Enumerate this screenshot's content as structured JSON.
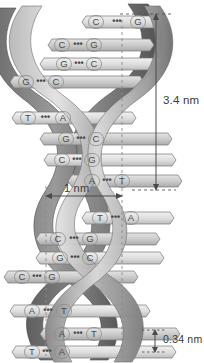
{
  "colors": {
    "background": "#ffffff",
    "ribbon_front_light": "#d8d8d8",
    "ribbon_front_dark": "#8f8f8f",
    "ribbon_back_dark": "#6f6f6f",
    "ribbon_back_darkest": "#555555",
    "rung_fill_light": "#e9e9e9",
    "rung_fill_mid": "#cfcfcf",
    "rung_stroke": "#7a7a7a",
    "base_letter": "#4a4a4a",
    "dimension_line": "#555555",
    "guide_dashed": "#8a8a8a",
    "label_text": "#3a3a3a"
  },
  "dimensions": {
    "pitch": {
      "label": "3.4 nm",
      "name": "helical-pitch",
      "orientation": "vertical",
      "side": "right"
    },
    "diameter": {
      "label": "1 nm",
      "name": "helix-diameter",
      "orientation": "horizontal",
      "side": "middle-left"
    },
    "rise": {
      "label": "0.34 nm",
      "name": "base-pair-rise",
      "orientation": "vertical",
      "side": "bottom-right"
    }
  },
  "base_pairs": [
    {
      "index": 1,
      "left": "C",
      "right": "G",
      "bond": "•••",
      "y": 22,
      "x_left": 96,
      "x_right": 138
    },
    {
      "index": 2,
      "left": "C",
      "right": "G",
      "bond": "•••",
      "y": 45,
      "x_left": 62,
      "x_right": 94
    },
    {
      "index": 3,
      "left": "G",
      "right": "C",
      "bond": "•••",
      "y": 64,
      "x_left": 64,
      "x_right": 94
    },
    {
      "index": 4,
      "left": "G",
      "right": "C",
      "bond": "•••",
      "y": 82,
      "x_left": 26,
      "x_right": 56
    },
    {
      "index": 5,
      "left": "T",
      "right": "A",
      "bond": "•••",
      "y": 118,
      "x_left": 28,
      "x_right": 63
    },
    {
      "index": 6,
      "left": "G",
      "right": "C",
      "bond": "•••",
      "y": 139,
      "x_left": 66,
      "x_right": 96
    },
    {
      "index": 7,
      "left": "C",
      "right": "G",
      "bond": "•••",
      "y": 160,
      "x_left": 62,
      "x_right": 92
    },
    {
      "index": 8,
      "left": "A",
      "right": "T",
      "bond": "•••",
      "y": 181,
      "x_left": 92,
      "x_right": 122
    },
    {
      "index": 9,
      "left": "T",
      "right": "A",
      "bond": "•••",
      "y": 218,
      "x_left": 100,
      "x_right": 131
    },
    {
      "index": 10,
      "left": "C",
      "right": "G",
      "bond": "•••",
      "y": 239,
      "x_left": 58,
      "x_right": 90
    },
    {
      "index": 11,
      "left": "G",
      "right": "C",
      "bond": "•••",
      "y": 258,
      "x_left": 60,
      "x_right": 90
    },
    {
      "index": 12,
      "left": "C",
      "right": "G",
      "bond": "•••",
      "y": 277,
      "x_left": 22,
      "x_right": 52
    },
    {
      "index": 13,
      "left": "A",
      "right": "T",
      "bond": "•••",
      "y": 311,
      "x_left": 32,
      "x_right": 64
    },
    {
      "index": 14,
      "left": "A",
      "right": "T",
      "bond": "•••",
      "y": 334,
      "x_left": 62,
      "x_right": 94
    },
    {
      "index": 15,
      "left": "T",
      "right": "A",
      "bond": "•••",
      "y": 352,
      "x_left": 32,
      "x_right": 62
    }
  ],
  "guides": {
    "left_dashed_x": 46,
    "right_dashed_x": 122,
    "top_tick_y": 14,
    "pitch_bottom_y": 190,
    "rise_top_y": 330,
    "rise_bottom_y": 352
  }
}
